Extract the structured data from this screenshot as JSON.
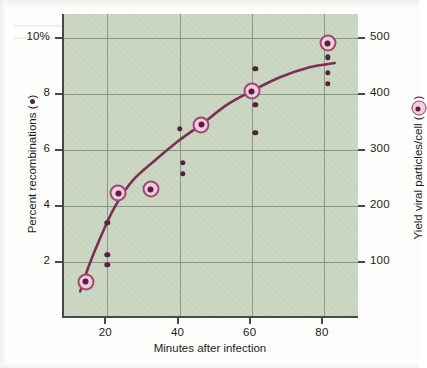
{
  "figure": {
    "background_color": "#c9d6c1",
    "curve_color": "#7a3055",
    "marker_ring_color": "#a04a73",
    "marker_fill_color": "#f0cbdd",
    "dot_color": "#58203d",
    "grid_color": "#7d8c78",
    "axis_color": "#4a4a46"
  },
  "chart_data": {
    "type": "scatter",
    "title": "",
    "xlabel": "Minutes after infection",
    "ylabel": "Percent recombinations (●)",
    "y2label": "Yield viral particles/cell ( ◉ )",
    "xlim": [
      8,
      90
    ],
    "ylim": [
      0,
      10.85
    ],
    "y2lim": [
      0,
      542
    ],
    "xticks": [
      20,
      40,
      60,
      80
    ],
    "xtick_labels": [
      "20",
      "40",
      "60",
      "80"
    ],
    "yticks": [
      2,
      4,
      6,
      8,
      10
    ],
    "ytick_labels": [
      "2",
      "4",
      "6",
      "8",
      "10%"
    ],
    "y2ticks": [
      100,
      200,
      300,
      400,
      500
    ],
    "y2tick_labels": [
      "100",
      "200",
      "300",
      "400",
      "500"
    ],
    "grid": true,
    "legend": "inline-in-axis-labels",
    "series": [
      {
        "name": "Yield viral particles/cell",
        "marker": "circled-dot",
        "axis": "right",
        "points": [
          {
            "x": 14,
            "y": 1.3,
            "y2": 65
          },
          {
            "x": 23,
            "y": 4.45,
            "y2": 222
          },
          {
            "x": 32,
            "y": 4.6,
            "y2": 230
          },
          {
            "x": 46,
            "y": 6.9,
            "y2": 345
          },
          {
            "x": 60,
            "y": 8.1,
            "y2": 405
          },
          {
            "x": 81,
            "y": 9.8,
            "y2": 490
          }
        ]
      },
      {
        "name": "Percent recombinations",
        "marker": "small-dot",
        "axis": "left",
        "points": [
          {
            "x": 20,
            "y": 3.4
          },
          {
            "x": 20,
            "y": 2.25
          },
          {
            "x": 20,
            "y": 1.9
          },
          {
            "x": 40,
            "y": 6.75
          },
          {
            "x": 41,
            "y": 5.55
          },
          {
            "x": 41,
            "y": 5.15
          },
          {
            "x": 61,
            "y": 8.9
          },
          {
            "x": 61,
            "y": 7.6
          },
          {
            "x": 61,
            "y": 6.6
          },
          {
            "x": 81,
            "y": 9.3
          },
          {
            "x": 81,
            "y": 8.75
          },
          {
            "x": 81,
            "y": 8.35
          }
        ]
      }
    ],
    "fit_curve": {
      "name": "fitted trend",
      "points": [
        {
          "x": 12.5,
          "y": 0.95
        },
        {
          "x": 15,
          "y": 1.9
        },
        {
          "x": 18,
          "y": 2.85
        },
        {
          "x": 22,
          "y": 3.95
        },
        {
          "x": 27,
          "y": 4.9
        },
        {
          "x": 33,
          "y": 5.6
        },
        {
          "x": 40,
          "y": 6.35
        },
        {
          "x": 46,
          "y": 6.9
        },
        {
          "x": 53,
          "y": 7.6
        },
        {
          "x": 60,
          "y": 8.1
        },
        {
          "x": 68,
          "y": 8.6
        },
        {
          "x": 76,
          "y": 8.95
        },
        {
          "x": 83,
          "y": 9.1
        }
      ]
    }
  },
  "axes": {
    "x_title": "Minutes after infection",
    "y_left_title_prefix": "Percent recombinations (",
    "y_left_title_suffix": ")",
    "y_right_title_prefix": "Yield viral particles/cell (",
    "y_right_title_suffix": ")"
  }
}
